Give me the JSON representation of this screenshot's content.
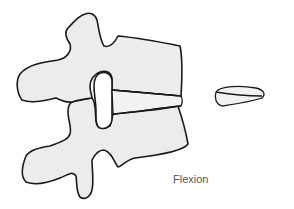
{
  "figure": {
    "label": "Flexion",
    "parts": [
      "upper-vertebra",
      "lower-vertebra",
      "intervertebral-disc",
      "isolated-disc"
    ],
    "colors": {
      "bone_fill": "#ececec",
      "outline": "#1a1a1a",
      "label": "#555555"
    }
  }
}
